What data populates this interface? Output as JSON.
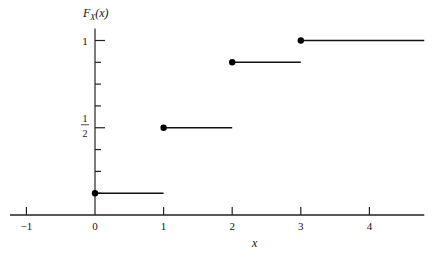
{
  "chart_data": {
    "type": "line",
    "subtype": "step-cdf",
    "title": "",
    "xlabel": "x",
    "ylabel": "F_X(x)",
    "xlim": [
      -1.2,
      4.8
    ],
    "ylim": [
      0,
      1
    ],
    "x_ticks": [
      -1,
      0,
      1,
      2,
      3,
      4
    ],
    "x_tick_labels": [
      "-1",
      "0",
      "1",
      "2",
      "3",
      "4"
    ],
    "y_ticks": [
      0.125,
      0.25,
      0.375,
      0.5,
      0.625,
      0.75,
      0.875,
      1
    ],
    "y_tick_labels": {
      "0.5": "1/2",
      "1": "1"
    },
    "grid": false,
    "legend": null,
    "steps": [
      {
        "x_start": 0,
        "x_end": 1,
        "y": 0.125
      },
      {
        "x_start": 1,
        "x_end": 2,
        "y": 0.5
      },
      {
        "x_start": 2,
        "x_end": 3,
        "y": 0.875
      },
      {
        "x_start": 3,
        "x_end": 4.8,
        "y": 1
      }
    ],
    "baseline": {
      "x_start": -1.2,
      "x_end": 0,
      "y": 0
    }
  },
  "labels": {
    "ylabel_main": "F",
    "ylabel_sub": "X",
    "ylabel_arg": "(x)",
    "xlabel": "x",
    "half_num": "1",
    "half_den": "2",
    "one": "1"
  }
}
